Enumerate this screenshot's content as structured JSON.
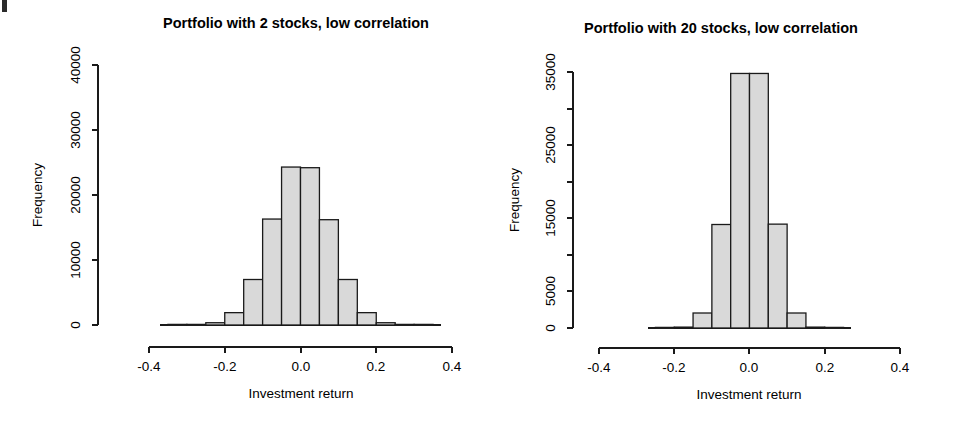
{
  "figure": {
    "width": 963,
    "height": 423,
    "background": "#ffffff",
    "bar_fill": "#d9d9d9",
    "bar_stroke": "#1a1a1a",
    "axis_color": "#1a1a1a"
  },
  "chart_data": [
    {
      "id": "left",
      "type": "bar",
      "title": "Portfolio with 2 stocks, low correlation",
      "xlabel": "Investment return",
      "ylabel": "Frequency",
      "xlim": [
        -0.4,
        0.4
      ],
      "ylim": [
        0,
        40000
      ],
      "grid": false,
      "legend": "none",
      "xticks": [
        -0.4,
        -0.2,
        0.0,
        0.2,
        0.4
      ],
      "xticklabels": [
        "-0.4",
        "-0.2",
        "0.0",
        "0.2",
        "0.4"
      ],
      "yticks": [
        0,
        10000,
        20000,
        30000,
        40000
      ],
      "yticklabels": [
        "0",
        "10000",
        "20000",
        "30000",
        "40000"
      ],
      "bin_width": 0.05,
      "bin_edges": [
        -0.35,
        -0.3,
        -0.25,
        -0.2,
        -0.15,
        -0.1,
        -0.05,
        0.0,
        0.05,
        0.1,
        0.15,
        0.2,
        0.25,
        0.3,
        0.35
      ],
      "bin_centers": [
        -0.325,
        -0.275,
        -0.225,
        -0.175,
        -0.125,
        -0.075,
        -0.025,
        0.025,
        0.075,
        0.125,
        0.175,
        0.225,
        0.275,
        0.325
      ],
      "values": [
        10,
        60,
        350,
        1900,
        7000,
        16300,
        24300,
        24200,
        16200,
        7000,
        1900,
        350,
        60,
        10
      ]
    },
    {
      "id": "right",
      "type": "bar",
      "title": "Portfolio with 20 stocks, low correlation",
      "xlabel": "Investment return",
      "ylabel": "Frequency",
      "xlim": [
        -0.4,
        0.4
      ],
      "ylim": [
        0,
        35000
      ],
      "grid": false,
      "legend": "none",
      "xticks": [
        -0.4,
        -0.2,
        0.0,
        0.2,
        0.4
      ],
      "xticklabels": [
        "-0.4",
        "-0.2",
        "0.0",
        "0.2",
        "0.4"
      ],
      "yticks": [
        0,
        5000,
        10000,
        15000,
        20000,
        25000,
        30000,
        35000
      ],
      "yticklabels_major": {
        "0": "0",
        "5000": "5000",
        "15000": "15000",
        "25000": "25000",
        "35000": "35000"
      },
      "bin_width": 0.05,
      "bin_edges": [
        -0.25,
        -0.2,
        -0.15,
        -0.1,
        -0.05,
        0.0,
        0.05,
        0.1,
        0.15,
        0.2,
        0.25
      ],
      "bin_centers": [
        -0.225,
        -0.175,
        -0.125,
        -0.075,
        -0.025,
        0.025,
        0.075,
        0.125,
        0.175,
        0.225
      ],
      "values": [
        20,
        120,
        2050,
        14150,
        34800,
        34800,
        14200,
        2050,
        120,
        20
      ]
    }
  ]
}
